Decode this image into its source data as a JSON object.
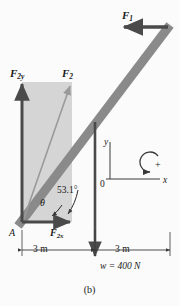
{
  "figure": {
    "caption": "(b)",
    "labels": {
      "force_1": "F",
      "force_1_sub": "1",
      "force_2": "F",
      "force_2_sub": "2",
      "force_2y": "F",
      "force_2y_sub": "2y",
      "force_2x": "F",
      "force_2x_sub": "2x",
      "pivot": "A",
      "theta": "θ",
      "angle_value": "53.1°",
      "weight": "w = 400 N",
      "axis_y": "y",
      "axis_x": "x",
      "origin": "0",
      "rotation_sign": "+",
      "dimension_left": "3 m",
      "dimension_right": "3 m"
    },
    "colors": {
      "beam": "#8a8a8a",
      "shaded_region": "#d5d5d5",
      "arrow": "#4a4a4a",
      "thin_line": "#3a3a3a",
      "background": "#fbfbfb"
    },
    "geometry": {
      "pivot_point": [
        22,
        222
      ],
      "beam_top_end": [
        168,
        27
      ],
      "beam_midpoint": [
        95,
        124
      ],
      "rect_top": [
        22,
        82
      ],
      "rect_right": [
        72,
        222
      ],
      "weight_arrow_bottom": [
        95,
        258
      ],
      "origin_point": [
        110,
        179
      ],
      "angle_degrees": 53.1,
      "weight_newtons": 400,
      "span_left_m": 3,
      "span_right_m": 3
    }
  }
}
